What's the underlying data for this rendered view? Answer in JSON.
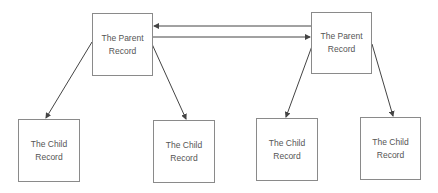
{
  "diagram": {
    "nodes": [
      {
        "id": "parent-left",
        "line1": "The Parent",
        "line2": "Record"
      },
      {
        "id": "parent-right",
        "line1": "The Parent",
        "line2": "Record"
      },
      {
        "id": "child-1",
        "line1": "The Child",
        "line2": "Record"
      },
      {
        "id": "child-2",
        "line1": "The Child",
        "line2": "Record"
      },
      {
        "id": "child-3",
        "line1": "The Child",
        "line2": "Record"
      },
      {
        "id": "child-4",
        "line1": "The Child",
        "line2": "Record"
      }
    ],
    "edges": [
      {
        "from": "parent-right",
        "to": "parent-left"
      },
      {
        "from": "parent-left",
        "to": "parent-right"
      },
      {
        "from": "parent-left",
        "to": "child-1"
      },
      {
        "from": "parent-left",
        "to": "child-2"
      },
      {
        "from": "parent-right",
        "to": "child-3"
      },
      {
        "from": "parent-right",
        "to": "child-4"
      }
    ],
    "colors": {
      "line": "#444444",
      "border": "#8a8a8a",
      "text": "#555555"
    }
  }
}
